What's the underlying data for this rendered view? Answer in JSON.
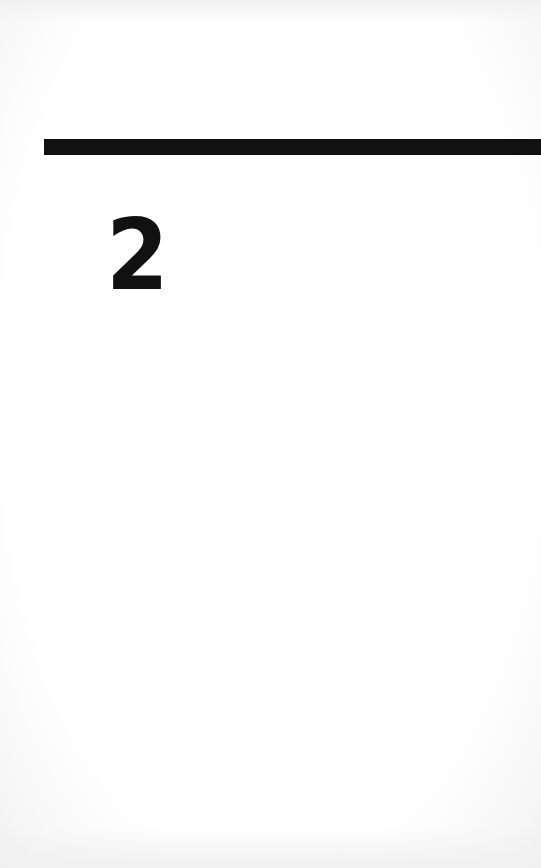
{
  "page": {
    "chapter_number": "2",
    "colors": {
      "ink": "#111111",
      "paper": "#ffffff"
    }
  }
}
